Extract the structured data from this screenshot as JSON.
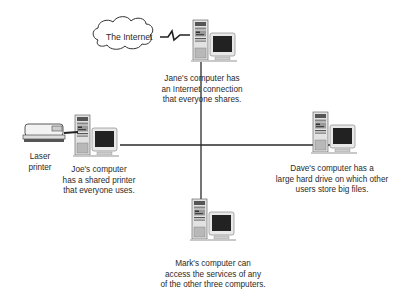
{
  "diagram": {
    "type": "network",
    "cloud": {
      "label": "The Internet"
    },
    "printer": {
      "label_lines": [
        "Laser",
        "printer"
      ]
    },
    "nodes": [
      {
        "id": "jane",
        "lines": [
          "Jane's computer has",
          "an Internet connection",
          "that everyone shares."
        ]
      },
      {
        "id": "joe",
        "lines": [
          "Joe's computer",
          "has a shared printer",
          "that everyone uses."
        ]
      },
      {
        "id": "dave",
        "lines": [
          "Dave's computer has a",
          "large hard drive on which other",
          "users store big files."
        ]
      },
      {
        "id": "mark",
        "lines": [
          "Mark's computer can",
          "access the services of any",
          "of the other three computers."
        ]
      }
    ],
    "colors": {
      "line": "#2a2a2a",
      "case": "#d8d8d8",
      "screen": "#1e1e1e",
      "bezel": "#e6e6e6"
    }
  }
}
